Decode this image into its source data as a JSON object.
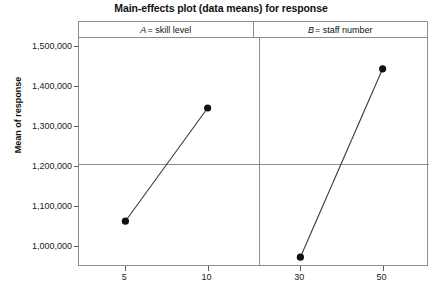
{
  "chart_data": {
    "type": "line",
    "title": "Main-effects plot (data means) for response",
    "xlabel": "",
    "ylabel": "Mean of response",
    "ylim": [
      950000,
      1520000
    ],
    "yticks": [
      1000000,
      1100000,
      1200000,
      1300000,
      1400000,
      1500000
    ],
    "ytick_labels": [
      "1,000,000",
      "1,100,000",
      "1,200,000",
      "1,300,000",
      "1,400,000",
      "1,500,000"
    ],
    "grid": false,
    "legend": "none",
    "reference_line": {
      "label": "grand mean",
      "value": 1205000,
      "orientation": "horizontal"
    },
    "panels": [
      {
        "id": "A",
        "factor_letter": "A",
        "header_text": "= skill level",
        "header_full": "A = skill level",
        "categories": [
          "5",
          "10"
        ],
        "values": [
          1062000,
          1345000
        ]
      },
      {
        "id": "B",
        "factor_letter": "B",
        "header_text": "= staff number",
        "header_full": "B = staff number",
        "categories": [
          "30",
          "50"
        ],
        "values": [
          972000,
          1443000
        ]
      }
    ]
  },
  "style": {
    "marker_color": "#121212",
    "line_color": "#3a3a3a",
    "frame_color": "#8e8e8e",
    "text_color": "#1b1b1b"
  }
}
